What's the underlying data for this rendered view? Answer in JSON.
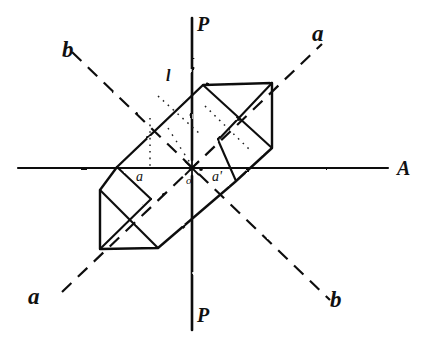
{
  "figure": {
    "kind": "crystallographic-projection-diagram",
    "ink_color": "#111111",
    "background_color": "#ffffff"
  },
  "labels": {
    "axis_p_top": "P",
    "axis_p_bottom": "P",
    "axis_a_right": "A",
    "axis_a_upper_right": "a",
    "axis_a_lower_left": "a",
    "axis_b_upper_left": "b",
    "axis_b_lower_right": "b",
    "edge_l_top": "l",
    "point_a_left": "a",
    "point_origin": "o",
    "point_a_prime_right": "a'"
  },
  "geometry": {
    "origin": {
      "x": 192,
      "y": 168
    },
    "horizontal_axis": {
      "x1": 18,
      "y1": 168,
      "x2": 388,
      "y2": 168,
      "style": "solid"
    },
    "vertical_axis": {
      "x1": 192,
      "y1": 18,
      "x2": 192,
      "y2": 330,
      "style": "solid"
    },
    "diagonal_axis_a": {
      "x1": 62,
      "y1": 292,
      "x2": 322,
      "y2": 44,
      "style": "dashed"
    },
    "diagonal_axis_b": {
      "x1": 72,
      "y1": 52,
      "x2": 330,
      "y2": 300,
      "style": "dashed"
    },
    "crystal_outline": [
      [
        117,
        167
      ],
      [
        203,
        85
      ],
      [
        272,
        83
      ],
      [
        272,
        148
      ],
      [
        235,
        182
      ],
      [
        158,
        248
      ],
      [
        100,
        249
      ],
      [
        100,
        190
      ]
    ],
    "internal_lines": [
      {
        "x1": 203,
        "y1": 85,
        "x2": 272,
        "y2": 148,
        "style": "solid"
      },
      {
        "x1": 272,
        "y1": 83,
        "x2": 218,
        "y2": 140,
        "style": "solid"
      },
      {
        "x1": 218,
        "y1": 140,
        "x2": 235,
        "y2": 182,
        "style": "solid"
      },
      {
        "x1": 100,
        "y1": 190,
        "x2": 158,
        "y2": 248,
        "style": "solid"
      },
      {
        "x1": 100,
        "y1": 249,
        "x2": 150,
        "y2": 200,
        "style": "solid"
      },
      {
        "x1": 150,
        "y1": 200,
        "x2": 117,
        "y2": 167,
        "style": "solid"
      },
      {
        "x1": 117,
        "y1": 167,
        "x2": 100,
        "y2": 190,
        "style": "solid"
      },
      {
        "x1": 272,
        "y1": 148,
        "x2": 235,
        "y2": 182,
        "style": "solid"
      }
    ],
    "dotted_construction_lines": [
      {
        "x1": 160,
        "y1": 97,
        "x2": 196,
        "y2": 130,
        "style": "dotted"
      },
      {
        "x1": 196,
        "y1": 130,
        "x2": 232,
        "y2": 162,
        "style": "dotted"
      },
      {
        "x1": 150,
        "y1": 120,
        "x2": 150,
        "y2": 168,
        "style": "dotted"
      },
      {
        "x1": 210,
        "y1": 108,
        "x2": 246,
        "y2": 148,
        "style": "dotted"
      }
    ]
  }
}
